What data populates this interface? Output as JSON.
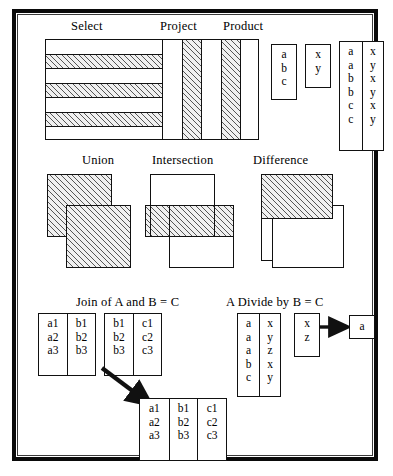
{
  "figure": {
    "border_color": "#0a0a0a",
    "hatch_color": "#555555"
  },
  "row1": {
    "labels": {
      "select": "Select",
      "project": "Project",
      "product": "Product"
    },
    "select_diagram": {
      "name": "select-stripes",
      "bands": [
        "white",
        "hatched",
        "white",
        "hatched",
        "white",
        "hatched",
        "white"
      ]
    },
    "project_diagram": {
      "name": "project-stripes",
      "bands": [
        "white",
        "hatched",
        "white",
        "hatched",
        "white"
      ]
    },
    "product_tables": {
      "operand_a": {
        "header": null,
        "rows": [
          "a",
          "b",
          "c"
        ]
      },
      "operand_b": {
        "header": null,
        "rows": [
          "x",
          "y"
        ]
      },
      "result": {
        "left": [
          "a",
          "a",
          "b",
          "b",
          "c",
          "c"
        ],
        "right": [
          "x",
          "y",
          "x",
          "y",
          "x",
          "y"
        ]
      }
    }
  },
  "row2": {
    "labels": {
      "union": "Union",
      "intersection": "Intersection",
      "difference": "Difference"
    },
    "union_diagram": {
      "shapes": [
        "hatched",
        "hatched"
      ]
    },
    "intersection_diagram": {
      "shapes": [
        "white",
        "white"
      ],
      "overlap": "hatched"
    },
    "difference_diagram": {
      "shapes": [
        "hatched",
        "white"
      ]
    }
  },
  "row3": {
    "join": {
      "label": "Join of A and B = C",
      "table_a": {
        "col1": [
          "a1",
          "a2",
          "a3"
        ],
        "col2": [
          "b1",
          "b2",
          "b3"
        ]
      },
      "table_b": {
        "col1": [
          "b1",
          "b2",
          "b3"
        ],
        "col2": [
          "c1",
          "c2",
          "c3"
        ]
      },
      "result": {
        "col1": [
          "a1",
          "a2",
          "a3"
        ],
        "col2": [
          "b1",
          "b2",
          "b3"
        ],
        "col3": [
          "c1",
          "c2",
          "c3"
        ]
      },
      "arrow": "down-right-arrow"
    },
    "divide": {
      "label": "A Divide by B = C",
      "table_a": {
        "col1": [
          "a",
          "a",
          "a",
          "b",
          "c"
        ],
        "col2": [
          "x",
          "y",
          "z",
          "x",
          "y"
        ]
      },
      "table_b": {
        "col1": [
          "x",
          "z"
        ]
      },
      "result": {
        "col1": [
          "a"
        ]
      },
      "arrow": "right-arrow"
    }
  }
}
